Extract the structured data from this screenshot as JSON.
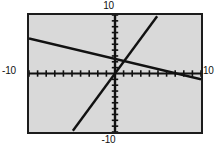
{
  "labels": {
    "top": "10",
    "bottom": "-10",
    "left": "-10",
    "right": "10"
  },
  "colors": {
    "plot_background": "#d9d9d9",
    "page_background": "#ffffff",
    "frame": "#1c1c1c",
    "axis": "#111111",
    "line": "#111111"
  },
  "chart_data": {
    "type": "line",
    "title": "",
    "xlabel": "",
    "ylabel": "",
    "xlim": [
      -10,
      10
    ],
    "ylim": [
      -10,
      10
    ],
    "grid": false,
    "legend": "none",
    "axis_ticks": {
      "x_tick_step": 1,
      "y_tick_step": 1,
      "x_ticks": [
        -10,
        -9,
        -8,
        -7,
        -6,
        -5,
        -4,
        -3,
        -2,
        -1,
        0,
        1,
        2,
        3,
        4,
        5,
        6,
        7,
        8,
        9,
        10
      ],
      "y_ticks": [
        -10,
        -9,
        -8,
        -7,
        -6,
        -5,
        -4,
        -3,
        -2,
        -1,
        0,
        1,
        2,
        3,
        4,
        5,
        6,
        7,
        8,
        9,
        10
      ]
    },
    "tick_labels": {
      "x_min": "-10",
      "x_max": "10",
      "y_min": "-10",
      "y_max": "10"
    },
    "series": [
      {
        "name": "line-negative-slope",
        "slope": -0.35,
        "intercept": 2.5,
        "x": [
          -10,
          10
        ],
        "y": [
          6.0,
          -1.0
        ],
        "style": "solid-thick"
      },
      {
        "name": "line-positive-slope",
        "slope": 3.0,
        "intercept": 0.0,
        "x": [
          -4.9,
          4.9
        ],
        "y": [
          -9.8,
          9.8
        ],
        "style": "solid-thick"
      }
    ]
  }
}
